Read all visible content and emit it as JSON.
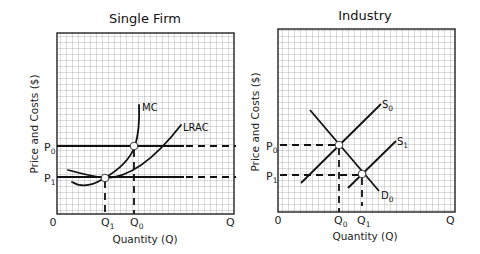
{
  "panels": [
    {
      "title": "Single Firm",
      "ylabel": "Price and Costs ($)",
      "xlabel": "Quantity (Q)",
      "origin_label": "0",
      "x_end_label": "Q",
      "y_ticks": [
        {
          "base": "P",
          "sub": "0"
        },
        {
          "base": "P",
          "sub": "1"
        }
      ],
      "x_ticks": [
        {
          "base": "Q",
          "sub": "1"
        },
        {
          "base": "Q",
          "sub": "0"
        }
      ],
      "curves": [
        {
          "label": "MC"
        },
        {
          "label": "LRAC"
        }
      ]
    },
    {
      "title": "Industry",
      "ylabel": "Price and Costs ($)",
      "xlabel": "Quantity (Q)",
      "origin_label": "0",
      "x_end_label": "Q",
      "y_ticks": [
        {
          "base": "P",
          "sub": "0"
        },
        {
          "base": "P",
          "sub": "1"
        }
      ],
      "x_ticks": [
        {
          "base": "Q",
          "sub": "0"
        },
        {
          "base": "Q",
          "sub": "1"
        }
      ],
      "curves": [
        {
          "label": "S",
          "sub": "0"
        },
        {
          "label": "S",
          "sub": "1"
        },
        {
          "label": "D",
          "sub": "0"
        }
      ]
    }
  ]
}
